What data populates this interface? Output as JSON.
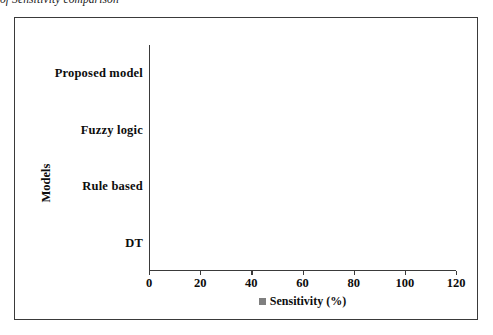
{
  "figure": {
    "caption": "of Sensitivity comparison"
  },
  "chart_data": {
    "type": "bar",
    "orientation": "horizontal",
    "title": "",
    "categories": [
      "DT",
      "Rule based",
      "Fuzzy logic",
      "Proposed model"
    ],
    "values": [
      72,
      87.5,
      92,
      97.5
    ],
    "series": [
      {
        "name": "Sensitivity (%)",
        "values": [
          72,
          87.5,
          92,
          97.5
        ],
        "color": "#7f7f7f"
      }
    ],
    "xlabel": "",
    "ylabel": "Models",
    "xlim": [
      0,
      120
    ],
    "xticks": [
      0,
      20,
      40,
      60,
      80,
      100,
      120
    ],
    "xtick_labels": [
      "0",
      "20",
      "40",
      "60",
      "80",
      "100",
      "120"
    ],
    "grid": false,
    "legend": {
      "position": "bottom",
      "entries": [
        "Sensitivity (%)"
      ]
    },
    "colors": {
      "bar": "#7f7f7f",
      "axis": "#3a3a3a",
      "border": "#3a3a3a",
      "text": "#0d0d0d",
      "background": "#ffffff"
    }
  }
}
